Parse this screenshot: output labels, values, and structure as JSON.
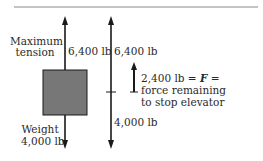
{
  "diagram": {
    "type": "free-body force diagram",
    "colors": {
      "ink": "#1a1a1a",
      "box_fill": "#777777",
      "rule": "#888888"
    },
    "labels": {
      "max_tension_line1": "Maximum",
      "max_tension_line2": "tension",
      "tension_value_left": "6,400 lb",
      "tension_value_right": "6,400 lb",
      "weight_label": "Weight",
      "weight_value_left": "4,000 lb",
      "weight_value_right": "4,000 lb",
      "net_force_value": "2,400 lb =",
      "net_force_symbol": "F",
      "net_force_eq": "=",
      "net_force_desc_line1": "force remaining",
      "net_force_desc_line2": "to stop elevator"
    },
    "forces": [
      {
        "name": "Maximum tension",
        "value_lb": 6400,
        "direction": "up"
      },
      {
        "name": "Weight",
        "value_lb": 4000,
        "direction": "down"
      },
      {
        "name": "F (net force remaining to stop elevator)",
        "value_lb": 2400,
        "direction": "up"
      }
    ]
  }
}
